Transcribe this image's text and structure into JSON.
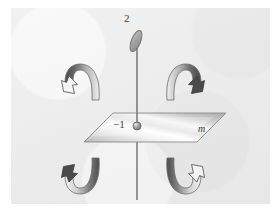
{
  "figure": {
    "caption_labels": {
      "top_point": "2",
      "center_point": "−1",
      "plane": "m"
    },
    "colors": {
      "background": "#ffffff",
      "panel": "#ebebeb",
      "axis_line": "#4a4a4a",
      "plane_light": "#fdfdfd",
      "plane_mid": "#c9c9c9",
      "plane_edge": "#8d8d8d",
      "arrow_dark": "#4f4f4f",
      "arrow_light": "#e9e9e9",
      "arrow_outline": "#6b6b6b",
      "ellipse_fill": "#a9a9a9",
      "ellipse_stroke": "#6e6e6e",
      "dot_fill": "#9a9a9a",
      "text": "#3b3b3b"
    },
    "elements": {
      "vertical_axis": {
        "name": "rotation-axis-line",
        "x": 137,
        "y_top": 48,
        "y_bottom": 200
      },
      "top_ellipse": {
        "name": "top-ellipse-marker",
        "cx": 136,
        "cy": 41,
        "rx": 4.5,
        "ry": 11,
        "rotation_deg": 22
      },
      "center_dot": {
        "name": "center-point-dot",
        "cx": 137,
        "cy": 126,
        "r": 4
      },
      "mirror_plane": {
        "name": "mirror-plane-parallelogram",
        "points": "84,142 113,113 226,113 197,142"
      },
      "arrows": [
        {
          "id": "arrow-top-left",
          "head": "open",
          "direction": "down-left",
          "quadrant": "top-left"
        },
        {
          "id": "arrow-top-right",
          "head": "filled",
          "direction": "down-right",
          "quadrant": "top-right"
        },
        {
          "id": "arrow-bottom-left",
          "head": "filled",
          "direction": "up-left",
          "quadrant": "bottom-left"
        },
        {
          "id": "arrow-bottom-right",
          "head": "open",
          "direction": "up-right",
          "quadrant": "bottom-right"
        }
      ]
    }
  }
}
